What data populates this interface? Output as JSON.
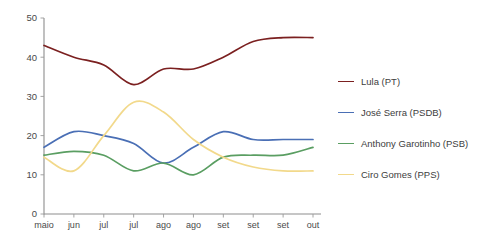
{
  "chart_data": {
    "type": "line",
    "title": "",
    "subtitle": "",
    "xlabel": "",
    "ylabel": "",
    "grid": false,
    "legend_position": "right",
    "x": [
      "maio",
      "jun",
      "jul",
      "jul",
      "ago",
      "ago",
      "set",
      "set",
      "set",
      "out"
    ],
    "xtick_labels": [
      "maio",
      "jun",
      "jul",
      "jul",
      "ago",
      "ago",
      "set",
      "set",
      "set",
      "out"
    ],
    "ytick_labels": [
      "0",
      "10",
      "20",
      "30",
      "40",
      "50"
    ],
    "ytick_values": [
      0,
      10,
      20,
      30,
      40,
      50
    ],
    "ylim": [
      0,
      50
    ],
    "series": [
      {
        "name": "Lula (PT)",
        "color": "#7b2020",
        "values": [
          43,
          40,
          38,
          33,
          37,
          37,
          40,
          44,
          45,
          45
        ]
      },
      {
        "name": "José Serra (PSDB)",
        "color": "#4a6fb5",
        "values": [
          17,
          21,
          20,
          18,
          13,
          17,
          21,
          19,
          19,
          19
        ]
      },
      {
        "name": "Anthony Garotinho (PSB)",
        "color": "#5a9e62",
        "values": [
          15,
          16,
          15,
          11,
          13,
          10,
          14.5,
          15,
          15,
          17
        ]
      },
      {
        "name": "Ciro Gomes (PPS)",
        "color": "#f2d98b",
        "values": [
          14.5,
          11,
          20,
          28.5,
          26,
          19,
          14.5,
          12,
          11,
          11
        ]
      }
    ]
  },
  "legend": {
    "items": [
      {
        "label": "Lula (PT)",
        "color": "#7b2020"
      },
      {
        "label": "José Serra (PSDB)",
        "color": "#4a6fb5"
      },
      {
        "label": "Anthony Garotinho (PSB)",
        "color": "#5a9e62"
      },
      {
        "label": "Ciro Gomes (PPS)",
        "color": "#f2d98b"
      }
    ]
  }
}
